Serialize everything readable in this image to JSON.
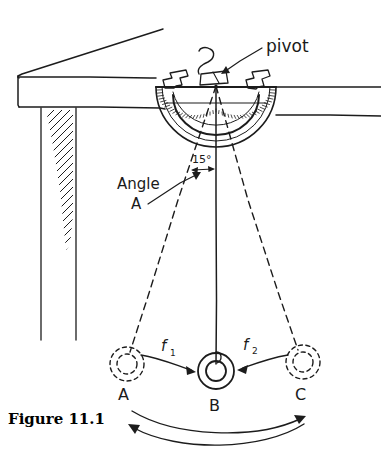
{
  "figure": {
    "caption": "Figure 11.1",
    "labels": {
      "pivot": "pivot",
      "angle_line1": "Angle",
      "angle_line2": "A",
      "angle_value": "15°",
      "force_1": "f",
      "force_1_sub": "1",
      "force_2": "f",
      "force_2_sub": "2",
      "position_a": "A",
      "position_b": "B",
      "position_c": "C"
    },
    "colors": {
      "ink": "#1c1c1c",
      "paper": "#ffffff",
      "caption": "#000000"
    },
    "geometry": {
      "pivot_x": 216,
      "pivot_y": 85,
      "bob_b_x": 216,
      "bob_b_y": 371,
      "bob_a_x": 127,
      "bob_a_y": 364,
      "bob_c_x": 303,
      "bob_c_y": 362,
      "swing_angle_deg": 15,
      "string_length_px": 286,
      "protractor_radius": 60
    },
    "elements": [
      "table-top",
      "table-edge",
      "table-leg",
      "protractor",
      "tape-left",
      "tape-right",
      "pivot-string-knot",
      "pendulum-string-center",
      "pendulum-string-left-dashed",
      "pendulum-string-right-dashed",
      "bob-b-solid",
      "bob-a-ghost",
      "bob-c-ghost",
      "force-arrow-f1",
      "force-arrow-f2",
      "angle-arrow",
      "swing-arc-right",
      "swing-arc-left"
    ]
  }
}
